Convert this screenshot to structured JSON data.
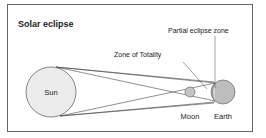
{
  "title": "Solar eclipse",
  "labels": {
    "sun": "Sun",
    "moon": "Moon",
    "earth": "Earth",
    "totality": "Zone of Totality",
    "partial": "Partial eclipse zone"
  },
  "colors": {
    "frame": "#555555",
    "sun_fill": "#e8e8e8",
    "moon_fill": "#c4c4c4",
    "earth_fill": "#bdbdbd"
  }
}
